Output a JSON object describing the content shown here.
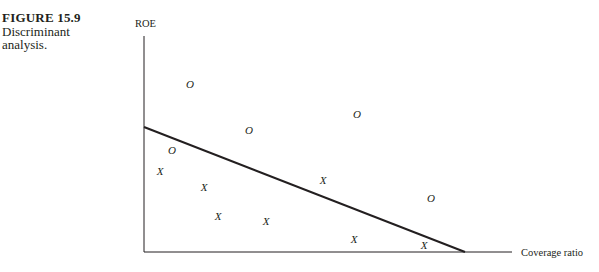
{
  "caption": {
    "figure_number": "FIGURE 15.9",
    "description_line1": "Discriminant",
    "description_line2": "analysis."
  },
  "chart_data": {
    "type": "scatter",
    "title": "Discriminant analysis.",
    "figure_label": "FIGURE 15.9",
    "xlabel": "Coverage ratio",
    "ylabel": "ROE",
    "grid": false,
    "legend": null,
    "axis_ticks": "none",
    "series": [
      {
        "name": "O",
        "marker": "O",
        "points": [
          {
            "x": 0.14,
            "y": 0.77
          },
          {
            "x": 0.58,
            "y": 0.64
          },
          {
            "x": 0.29,
            "y": 0.56
          },
          {
            "x": 0.08,
            "y": 0.47
          },
          {
            "x": 0.78,
            "y": 0.25
          }
        ]
      },
      {
        "name": "X",
        "marker": "X",
        "points": [
          {
            "x": 0.04,
            "y": 0.38
          },
          {
            "x": 0.16,
            "y": 0.3
          },
          {
            "x": 0.49,
            "y": 0.33
          },
          {
            "x": 0.2,
            "y": 0.17
          },
          {
            "x": 0.33,
            "y": 0.14
          },
          {
            "x": 0.57,
            "y": 0.06
          },
          {
            "x": 0.76,
            "y": 0.03
          }
        ]
      }
    ],
    "discriminant_line": {
      "x": [
        0.0,
        0.87
      ],
      "y": [
        0.58,
        0.0
      ]
    },
    "xlim": [
      0,
      1
    ],
    "ylim": [
      0,
      1
    ]
  },
  "plot": {
    "origin": [
      144,
      252
    ],
    "x_end": 512,
    "y_top": 36,
    "line_start": [
      144,
      127
    ],
    "line_end": [
      465,
      252
    ],
    "o_markers": [
      [
        190,
        84
      ],
      [
        357,
        114
      ],
      [
        249,
        130
      ],
      [
        172,
        150
      ],
      [
        431,
        198
      ]
    ],
    "x_markers": [
      [
        160,
        171
      ],
      [
        204,
        187
      ],
      [
        323,
        180
      ],
      [
        218,
        216
      ],
      [
        266,
        221
      ],
      [
        354,
        239
      ],
      [
        424,
        245
      ]
    ]
  }
}
